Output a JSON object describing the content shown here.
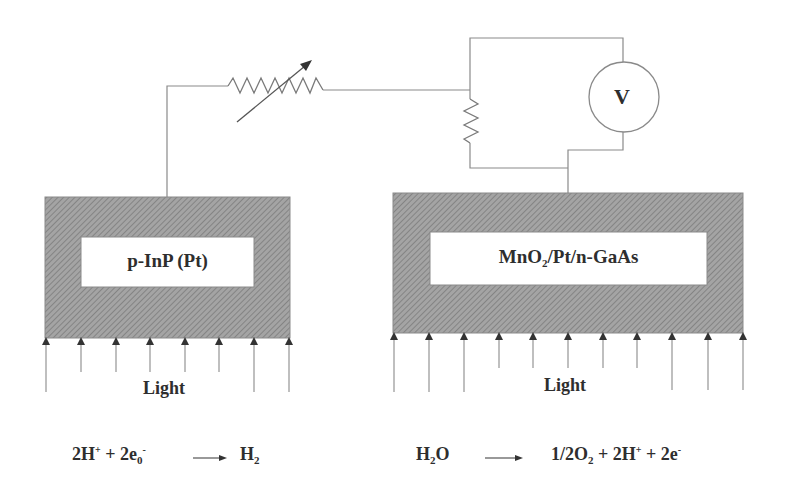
{
  "diagram": {
    "type": "photoelectrochemical cell circuit",
    "left_electrode": {
      "label_main": "p-InP (Pt)",
      "light_label": "Light",
      "arrow_count": 8
    },
    "right_electrode": {
      "label_parts": {
        "a": "MnO",
        "a_sub": "2",
        "b": "/Pt/n-GaAs"
      },
      "light_label": "Light",
      "arrow_count": 11
    },
    "circuit": {
      "variable_resistor": "variable-resistor",
      "shunt_resistor": "resistor",
      "voltmeter_label": "V"
    },
    "equations": {
      "left": {
        "p1": "2H",
        "p1_sup": "+",
        "p2": " + 2e",
        "p2_sub": "0",
        "p2_sup": "-",
        "arrow": "→",
        "p3": "H",
        "p3_sub": "2"
      },
      "right": {
        "p1": "H",
        "p1_sub": "2",
        "p2": "O",
        "arrow": "→",
        "p3": "1/2O",
        "p3_sub": "2",
        "p4": " + 2H",
        "p4_sup": "+",
        "p5": " + 2e",
        "p5_sup": "-"
      }
    },
    "colors": {
      "line": "#7a7a7a",
      "hatch_fill": "#9a9a9a",
      "text": "#2e2e2e"
    }
  }
}
